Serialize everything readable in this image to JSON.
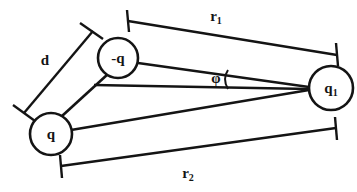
{
  "figure": {
    "background_color": "#ffffff",
    "ink_color": "#141414",
    "width": 357,
    "height": 192
  },
  "charges": {
    "negative": {
      "label": "-q",
      "name": "negative-charge",
      "cx": 118,
      "cy": 58,
      "r": 20
    },
    "positive": {
      "label": "q",
      "name": "positive-charge",
      "cx": 51,
      "cy": 134,
      "r": 21
    },
    "test": {
      "label_base": "q",
      "label_sub": "1",
      "name": "test-charge",
      "cx": 331,
      "cy": 88,
      "r": 22
    }
  },
  "dimensions": {
    "r1": {
      "label_base": "r",
      "label_sub": "1",
      "name": "distance-r1",
      "description": "distance from -q to q1"
    },
    "r2": {
      "label_base": "r",
      "label_sub": "2",
      "name": "distance-r2",
      "description": "distance from q to q1"
    },
    "d": {
      "label_base": "d",
      "label_sub": "",
      "name": "dipole-separation",
      "description": "separation between q and -q"
    }
  },
  "angle": {
    "label": "φ",
    "name": "angle-phi",
    "description": "angle at q1 between line to -q and horizontal reference"
  }
}
